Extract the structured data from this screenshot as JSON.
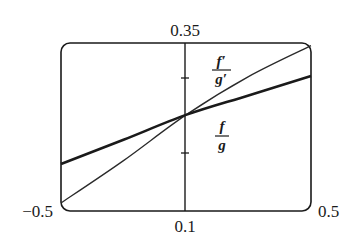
{
  "chart_data": {
    "type": "line",
    "title": "",
    "xlabel": "",
    "ylabel": "",
    "xlim": [
      -0.5,
      0.5
    ],
    "ylim": [
      0.1,
      0.35
    ],
    "grid": false,
    "legend_position": "inline labels",
    "tick_labels": {
      "x_min": "−0.5",
      "x_max": "0.5",
      "y_min": "0.1",
      "y_max": "0.35"
    },
    "series": [
      {
        "name": "f'/g'",
        "label_numerator": "f′",
        "label_denominator": "g′",
        "style": "thin",
        "x": [
          -0.5,
          -0.25,
          0.0,
          0.25,
          0.5
        ],
        "values": [
          0.112,
          0.175,
          0.243,
          0.3,
          0.346
        ]
      },
      {
        "name": "f/g",
        "label_numerator": "f",
        "label_denominator": "g",
        "style": "thick",
        "x": [
          -0.5,
          -0.25,
          0.0,
          0.25,
          0.5
        ],
        "values": [
          0.17,
          0.206,
          0.243,
          0.272,
          0.301
        ]
      }
    ],
    "annotations": [
      "Curves intersect at x = 0, y ≈ 0.243"
    ],
    "y_axis_ticks_px_hint": [
      0.186,
      0.298
    ]
  }
}
